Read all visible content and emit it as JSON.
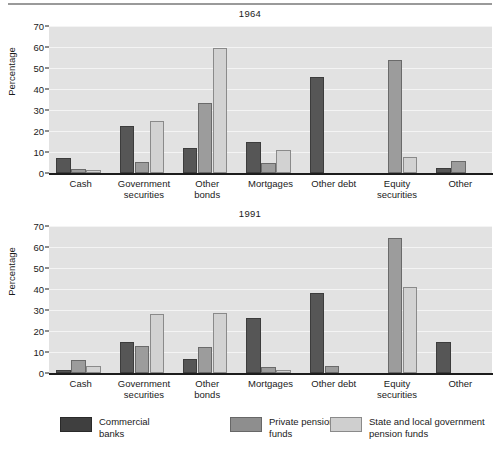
{
  "chart_data": [
    {
      "type": "bar",
      "title": "1964",
      "xlabel": "",
      "ylabel": "Percentage",
      "ylim": [
        0,
        70
      ],
      "yticks": [
        0,
        10,
        20,
        30,
        40,
        50,
        60,
        70
      ],
      "grid": true,
      "legend_position": "bottom",
      "categories": [
        "Cash",
        "Government\nsecurities",
        "Other\nbonds",
        "Mortgages",
        "Other debt",
        "Equity\nsecurities",
        "Other"
      ],
      "series": [
        {
          "name": "Commercial banks",
          "color": "#565656",
          "values": [
            7.3,
            22.5,
            12.0,
            15.0,
            45.5,
            0.0,
            2.2
          ]
        },
        {
          "name": "Private pension funds",
          "color": "#9c9c9c",
          "values": [
            1.8,
            5.4,
            33.5,
            5.0,
            0.0,
            53.7,
            5.8
          ]
        },
        {
          "name": "State and local government pension funds",
          "color": "#d2d2d2",
          "values": [
            1.2,
            24.7,
            59.3,
            11.0,
            0.0,
            7.8,
            0.0
          ]
        }
      ]
    },
    {
      "type": "bar",
      "title": "1991",
      "xlabel": "",
      "ylabel": "Percentage",
      "ylim": [
        0,
        70
      ],
      "yticks": [
        0,
        10,
        20,
        30,
        40,
        50,
        60,
        70
      ],
      "grid": true,
      "legend_position": "bottom",
      "categories": [
        "Cash",
        "Government\nsecurities",
        "Other\nbonds",
        "Mortgages",
        "Other debt",
        "Equity\nsecurities",
        "Other"
      ],
      "series": [
        {
          "name": "Commercial banks",
          "color": "#565656",
          "values": [
            1.6,
            15.0,
            6.5,
            26.0,
            38.0,
            0.0,
            15.0
          ]
        },
        {
          "name": "Private pension funds",
          "color": "#9c9c9c",
          "values": [
            6.0,
            13.0,
            12.5,
            2.8,
            3.5,
            64.5,
            0.0
          ]
        },
        {
          "name": "State and local government pension funds",
          "color": "#d2d2d2",
          "values": [
            3.2,
            28.0,
            28.5,
            1.4,
            0.0,
            40.8,
            0.0
          ]
        }
      ]
    }
  ],
  "panels": {
    "top": {
      "title": "1964",
      "ylabel": "Percentage"
    },
    "bottom": {
      "title": "1991",
      "ylabel": "Percentage"
    }
  },
  "legend": {
    "items": [
      {
        "label": "Commercial\nbanks",
        "swatch": "s0"
      },
      {
        "label": "Private pension\nfunds",
        "swatch": "s1"
      },
      {
        "label": "State and local government\npension funds",
        "swatch": "s2"
      }
    ]
  }
}
